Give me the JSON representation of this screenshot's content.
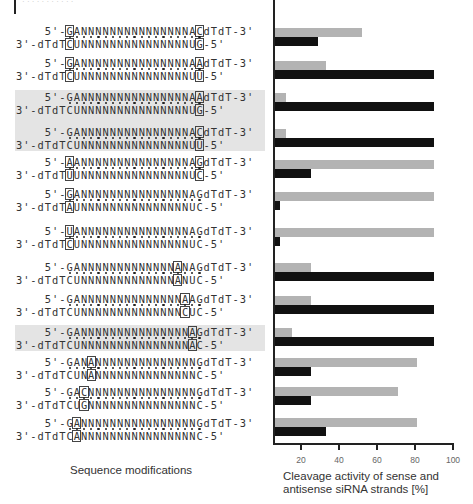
{
  "header": {
    "faint_text": "· · · · · · · · · · ·"
  },
  "labels": {
    "sequence_axis": "Sequence modifications",
    "value_axis_line1": "Cleavage activity of sense and",
    "value_axis_line2": "antisense siRNA strands [%]"
  },
  "colors": {
    "sense_bar": "#b3b3b3",
    "antisense_bar": "#111111",
    "highlight_band": "#e4e4e4"
  },
  "rows": [
    {
      "y": 26,
      "sense": "GANNNNNNNNNNNNNNNAC",
      "antisense": "CUNNNNNNNNNNNNNNNUG",
      "boxed": [
        1,
        19
      ],
      "shaded": false,
      "sense_activity": 52,
      "antisense_activity": 29,
      "bar_y": 28
    },
    {
      "y": 58,
      "sense": "GANNNNNNNNNNNNNNNAA",
      "antisense": "CUNNNNNNNNNNNNNNNUU",
      "boxed": [
        1,
        19
      ],
      "shaded": false,
      "sense_activity": 33,
      "antisense_activity": 90,
      "bar_y": 61
    },
    {
      "y": 92,
      "sense": "GANNNNNNNNNNNNNNNAA",
      "antisense": "CUNNNNNNNNNNNNNNNUG",
      "boxed": [
        19
      ],
      "shaded": true,
      "sense_activity": 12,
      "antisense_activity": 90,
      "bar_y": 93
    },
    {
      "y": 127,
      "sense": "GANNNNNNNNNNNNNNNAC",
      "antisense": "CUNNNNNNNNNNNNNNNUU",
      "boxed": [
        19
      ],
      "shaded": true,
      "sense_activity": 12,
      "antisense_activity": 90,
      "bar_y": 129
    },
    {
      "y": 157,
      "sense": "AANNNNNNNNNNNNNNNAG",
      "antisense": "UUNNNNNNNNNNNNNNNUC",
      "boxed": [
        1,
        19
      ],
      "shaded": false,
      "sense_activity": 90,
      "antisense_activity": 25,
      "bar_y": 160
    },
    {
      "y": 189,
      "sense": "GANNNNNNNNNNNNNNNAG",
      "antisense": "AUNNNNNNNNNNNNNNNUC",
      "boxed": [
        1
      ],
      "shaded": false,
      "sense_activity": 90,
      "antisense_activity": 9,
      "bar_y": 192
    },
    {
      "y": 226,
      "sense": "UANNNNNNNNNNNNNNNAG",
      "antisense": "CUNNNNNNNNNNNNNNNUC",
      "boxed": [
        1
      ],
      "shaded": false,
      "sense_activity": 90,
      "antisense_activity": 9,
      "bar_y": 228
    },
    {
      "y": 262,
      "sense": "GANNNNNNNNNNNNNANAG",
      "antisense": "CUNNNNNNNNNNNNNANUC",
      "boxed": [
        16
      ],
      "shaded": false,
      "sense_activity": 25,
      "antisense_activity": 90,
      "bar_y": 263
    },
    {
      "y": 294,
      "sense": "GANNNNNNNNNNNNNNAAG",
      "antisense": "CUNNNNNNNNNNNNNNCUC",
      "boxed": [
        17
      ],
      "shaded": false,
      "sense_activity": 25,
      "antisense_activity": 90,
      "bar_y": 296
    },
    {
      "y": 327,
      "sense": "GANNNNNNNNNNNNNNNAG",
      "antisense": "CUNNNNNNNNNNNNNNNAC",
      "boxed": [
        18
      ],
      "shaded": true,
      "sense_activity": 15,
      "antisense_activity": 90,
      "bar_y": 328
    },
    {
      "y": 357,
      "sense": "GANANNNNNNNNNNNNNNG",
      "antisense": "CUNANNNNNNNNNNNNNNC",
      "boxed": [
        4
      ],
      "shaded": false,
      "sense_activity": 81,
      "antisense_activity": 25,
      "bar_y": 358
    },
    {
      "y": 387,
      "sense": "GACNNNNNNNNNNNNNNNG",
      "antisense": "CUGNNNNNNNNNNNNNNNC",
      "boxed": [
        3
      ],
      "shaded": false,
      "sense_activity": 71,
      "antisense_activity": 25,
      "bar_y": 387
    },
    {
      "y": 418,
      "sense": "GANNNNNNNNNNNNNNNNG",
      "antisense": "CANNNNNNNNNNNNNNNNC",
      "boxed": [
        2
      ],
      "shaded": false,
      "sense_activity": 81,
      "antisense_activity": 33,
      "bar_y": 418
    }
  ],
  "strand_ends": {
    "sense_prefix": "5'-",
    "sense_suffix": "dTdT-3'",
    "antisense_prefix": "3'-dTdT",
    "antisense_suffix": "-5'"
  },
  "chart_data": {
    "type": "bar",
    "orientation": "horizontal",
    "title": "",
    "xlabel": "Cleavage activity of sense and antisense siRNA strands [%]",
    "ylabel": "Sequence modifications",
    "xlim": [
      0,
      100
    ],
    "xticks": [
      20,
      40,
      60,
      80,
      100
    ],
    "grid": false,
    "categories": [
      "5'-[G]AN15A[C]dTdT-3' / 3'-dTdT[C]UN15U[G]-5'",
      "5'-[G]AN15A[A]dTdT-3' / 3'-dTdT[C]UN15U[U]-5'",
      "5'-GAN15A[A]dTdT-3' / 3'-dTdTCUN15U[G]-5'",
      "5'-GAN15A[C]dTdT-3' / 3'-dTdTCUN15U[U]-5'",
      "5'-[A]AN15A[G]dTdT-3' / 3'-dTdT[U]UN15U[C]-5'",
      "5'-[G]AN15AGdTdT-3' / 3'-dTdT[A]UN15UC-5'",
      "5'-[U]AN15AGdTdT-3' / 3'-dTdT[C]UN15UC-5'",
      "5'-GAN13[A]NAGdTdT-3' / 3'-dTdTCUN13[A]NUC-5'",
      "5'-GAN14[A]AGdTdT-3' / 3'-dTdTCUN14[C]UC-5'",
      "5'-GAN15[A]GdTdT-3' / 3'-dTdTCUN15[A]C-5'",
      "5'-GAN[A]N14GdTdT-3' / 3'-dTdTCUN[A]N14C-5'",
      "5'-GA[C]N15GdTdT-3' / 3'-dTdTCU[G]N15C-5'",
      "5'-G[A]N16GdTdT-3' / 3'-dTdTC[A]N16C-5'"
    ],
    "series": [
      {
        "name": "sense strand",
        "color": "#b3b3b3",
        "values": [
          52,
          33,
          12,
          12,
          90,
          90,
          90,
          25,
          25,
          15,
          81,
          71,
          81
        ]
      },
      {
        "name": "antisense strand",
        "color": "#111111",
        "values": [
          29,
          90,
          90,
          90,
          25,
          9,
          9,
          90,
          90,
          90,
          25,
          25,
          33
        ]
      }
    ],
    "highlighted_rows": [
      3,
      4,
      10
    ]
  }
}
